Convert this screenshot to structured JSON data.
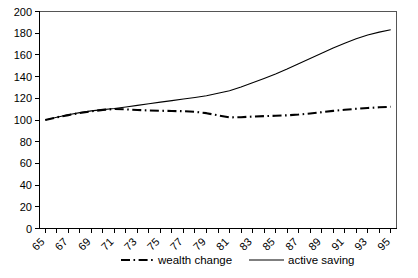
{
  "chart_data": {
    "type": "line",
    "title": "",
    "subtitle": "",
    "xlabel": "",
    "ylabel": "",
    "xlim": [
      65,
      95
    ],
    "ylim": [
      0,
      200
    ],
    "grid": false,
    "legend_position": "bottom",
    "x": [
      65,
      66,
      67,
      68,
      69,
      70,
      71,
      72,
      73,
      74,
      75,
      76,
      77,
      78,
      79,
      80,
      81,
      82,
      83,
      84,
      85,
      86,
      87,
      88,
      89,
      90,
      91,
      92,
      93,
      94,
      95
    ],
    "x_tick_labels": [
      "65",
      "67",
      "69",
      "71",
      "73",
      "75",
      "77",
      "79",
      "81",
      "83",
      "85",
      "87",
      "89",
      "91",
      "93",
      "95"
    ],
    "x_tick_values": [
      65,
      67,
      69,
      71,
      73,
      75,
      77,
      79,
      81,
      83,
      85,
      87,
      89,
      91,
      93,
      95
    ],
    "y_tick_labels": [
      "0",
      "20",
      "40",
      "60",
      "80",
      "100",
      "120",
      "140",
      "160",
      "180",
      "200"
    ],
    "y_tick_values": [
      0,
      20,
      40,
      60,
      80,
      100,
      120,
      140,
      160,
      180,
      200
    ],
    "series": [
      {
        "name": "wealth change",
        "style": "dash-dot",
        "color": "#000000",
        "values": [
          100,
          102.5,
          104.5,
          106.5,
          108,
          109.3,
          110.2,
          109.8,
          109.2,
          108.8,
          108.5,
          108.3,
          108.1,
          107.5,
          106.3,
          104.3,
          102.4,
          102.6,
          103.2,
          103.6,
          103.9,
          104.3,
          105.0,
          106.0,
          107.2,
          108.4,
          109.4,
          110.3,
          111.1,
          111.7,
          112.2
        ]
      },
      {
        "name": "active saving",
        "style": "solid",
        "color": "#000000",
        "values": [
          100,
          102.5,
          104.8,
          106.8,
          108.4,
          109.6,
          110.6,
          112.0,
          113.5,
          115.0,
          116.5,
          117.9,
          119.3,
          120.8,
          122.3,
          124.6,
          127.0,
          130.5,
          134.3,
          138.3,
          142.5,
          147.0,
          151.8,
          156.6,
          161.5,
          166.3,
          170.8,
          174.8,
          178.3,
          181.0,
          183.2
        ]
      }
    ]
  },
  "legend": {
    "items": [
      {
        "label": "wealth change",
        "style": "dash-dot"
      },
      {
        "label": "active saving",
        "style": "solid"
      }
    ]
  }
}
